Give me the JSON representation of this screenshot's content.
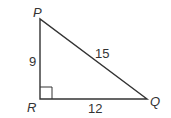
{
  "diagram": {
    "vertices": {
      "P": "P",
      "Q": "Q",
      "R": "R"
    },
    "sides": {
      "PR": "9",
      "PQ": "15",
      "RQ": "12"
    },
    "right_angle_at": "R",
    "colors": {
      "stroke": "#333333",
      "text": "#333333"
    }
  }
}
